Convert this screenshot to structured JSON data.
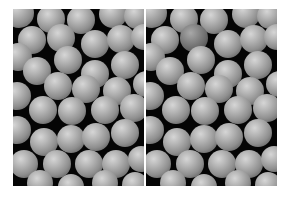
{
  "figure": {
    "panels": [
      {
        "id": "left",
        "label": "",
        "background": "#050505",
        "sphere_color": "#a8a8a8",
        "spheres": [
          {
            "x": 6,
            "y": 4,
            "r": 15
          },
          {
            "x": 38,
            "y": 10,
            "r": 14
          },
          {
            "x": 68,
            "y": 11,
            "r": 14
          },
          {
            "x": 100,
            "y": 5,
            "r": 14
          },
          {
            "x": 124,
            "y": 7,
            "r": 13
          },
          {
            "x": 19,
            "y": 31,
            "r": 14
          },
          {
            "x": 48,
            "y": 29,
            "r": 14
          },
          {
            "x": 82,
            "y": 35,
            "r": 14
          },
          {
            "x": 108,
            "y": 30,
            "r": 14
          },
          {
            "x": 131,
            "y": 28,
            "r": 13
          },
          {
            "x": 5,
            "y": 48,
            "r": 14
          },
          {
            "x": 24,
            "y": 62,
            "r": 14
          },
          {
            "x": 55,
            "y": 51,
            "r": 14
          },
          {
            "x": 82,
            "y": 65,
            "r": 14
          },
          {
            "x": 112,
            "y": 56,
            "r": 14
          },
          {
            "x": 133,
            "y": 75,
            "r": 13
          },
          {
            "x": 45,
            "y": 77,
            "r": 14
          },
          {
            "x": 73,
            "y": 80,
            "r": 14
          },
          {
            "x": 104,
            "y": 82,
            "r": 14
          },
          {
            "x": 4,
            "y": 87,
            "r": 14
          },
          {
            "x": 30,
            "y": 101,
            "r": 14
          },
          {
            "x": 59,
            "y": 102,
            "r": 14
          },
          {
            "x": 92,
            "y": 101,
            "r": 14
          },
          {
            "x": 121,
            "y": 99,
            "r": 14
          },
          {
            "x": 4,
            "y": 121,
            "r": 14
          },
          {
            "x": 31,
            "y": 133,
            "r": 14
          },
          {
            "x": 58,
            "y": 130,
            "r": 14
          },
          {
            "x": 83,
            "y": 128,
            "r": 14
          },
          {
            "x": 112,
            "y": 124,
            "r": 14
          },
          {
            "x": 11,
            "y": 155,
            "r": 14
          },
          {
            "x": 44,
            "y": 155,
            "r": 14
          },
          {
            "x": 76,
            "y": 155,
            "r": 14
          },
          {
            "x": 103,
            "y": 155,
            "r": 14
          },
          {
            "x": 128,
            "y": 150,
            "r": 13
          },
          {
            "x": 27,
            "y": 174,
            "r": 13
          },
          {
            "x": 58,
            "y": 178,
            "r": 13
          },
          {
            "x": 92,
            "y": 174,
            "r": 13
          },
          {
            "x": 122,
            "y": 176,
            "r": 13
          }
        ]
      },
      {
        "id": "right",
        "label": "",
        "background": "#050505",
        "sphere_color": "#a8a8a8",
        "spheres": [
          {
            "x": 6,
            "y": 4,
            "r": 15
          },
          {
            "x": 38,
            "y": 10,
            "r": 14
          },
          {
            "x": 68,
            "y": 11,
            "r": 14
          },
          {
            "x": 100,
            "y": 5,
            "r": 14
          },
          {
            "x": 124,
            "y": 7,
            "r": 13
          },
          {
            "x": 19,
            "y": 31,
            "r": 14
          },
          {
            "x": 48,
            "y": 29,
            "r": 14,
            "dark": true
          },
          {
            "x": 82,
            "y": 35,
            "r": 14
          },
          {
            "x": 108,
            "y": 30,
            "r": 14
          },
          {
            "x": 131,
            "y": 28,
            "r": 13
          },
          {
            "x": 5,
            "y": 48,
            "r": 14
          },
          {
            "x": 24,
            "y": 62,
            "r": 14
          },
          {
            "x": 55,
            "y": 51,
            "r": 14
          },
          {
            "x": 82,
            "y": 65,
            "r": 14
          },
          {
            "x": 112,
            "y": 56,
            "r": 14
          },
          {
            "x": 133,
            "y": 75,
            "r": 13
          },
          {
            "x": 45,
            "y": 77,
            "r": 14
          },
          {
            "x": 73,
            "y": 80,
            "r": 14
          },
          {
            "x": 104,
            "y": 82,
            "r": 14
          },
          {
            "x": 4,
            "y": 87,
            "r": 14
          },
          {
            "x": 30,
            "y": 101,
            "r": 14
          },
          {
            "x": 59,
            "y": 102,
            "r": 14
          },
          {
            "x": 92,
            "y": 101,
            "r": 14
          },
          {
            "x": 121,
            "y": 99,
            "r": 14
          },
          {
            "x": 4,
            "y": 121,
            "r": 14
          },
          {
            "x": 31,
            "y": 133,
            "r": 14
          },
          {
            "x": 58,
            "y": 130,
            "r": 14
          },
          {
            "x": 83,
            "y": 128,
            "r": 14
          },
          {
            "x": 112,
            "y": 124,
            "r": 14
          },
          {
            "x": 11,
            "y": 155,
            "r": 14
          },
          {
            "x": 44,
            "y": 155,
            "r": 14
          },
          {
            "x": 76,
            "y": 155,
            "r": 14
          },
          {
            "x": 103,
            "y": 155,
            "r": 14
          },
          {
            "x": 128,
            "y": 150,
            "r": 13
          },
          {
            "x": 27,
            "y": 174,
            "r": 13
          },
          {
            "x": 58,
            "y": 178,
            "r": 13
          },
          {
            "x": 92,
            "y": 174,
            "r": 13
          },
          {
            "x": 122,
            "y": 176,
            "r": 13
          }
        ]
      }
    ]
  }
}
